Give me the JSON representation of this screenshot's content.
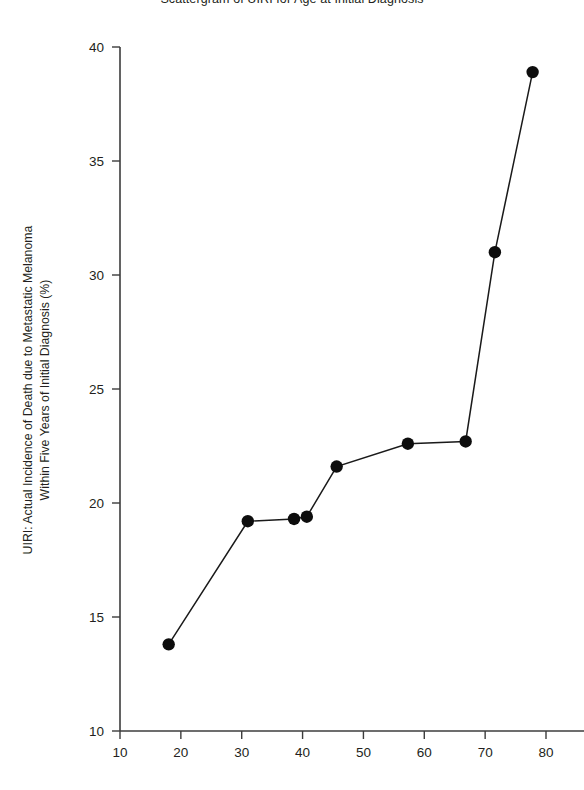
{
  "chart_data": {
    "type": "scatter",
    "title": "Scattergram of UIRI for Age at Initial Diagnosis",
    "xlabel": "",
    "ylabel": "UIRI: Actual Incidence of Death due to Metastatic Melanoma Within Five Years of Initial Diagnosis (%)",
    "ylabel_line1": "UIRI: Actual Incidence of Death due to Metastatic Melanoma",
    "ylabel_line2": "Within Five Years of Initial Diagnosis (%)",
    "xlim": [
      10,
      84
    ],
    "ylim": [
      10,
      40
    ],
    "xticks": [
      10,
      20,
      30,
      40,
      50,
      60,
      70,
      80
    ],
    "yticks": [
      10,
      15,
      20,
      25,
      30,
      35,
      40
    ],
    "grid": false,
    "legend": null,
    "connected": true,
    "marker": "filled-circle",
    "marker_color": "#0d0d0d",
    "line_color": "#1a1a1a",
    "x": [
      18,
      31,
      38.6,
      40.7,
      45.6,
      57.3,
      66.8,
      71.6,
      77.8
    ],
    "y": [
      13.8,
      19.2,
      19.3,
      19.4,
      21.6,
      22.6,
      22.7,
      31.0,
      38.9
    ],
    "points": [
      {
        "x": 18,
        "y": 13.8
      },
      {
        "x": 31,
        "y": 19.2
      },
      {
        "x": 38.6,
        "y": 19.3
      },
      {
        "x": 40.7,
        "y": 19.4
      },
      {
        "x": 45.6,
        "y": 21.6
      },
      {
        "x": 57.3,
        "y": 22.6
      },
      {
        "x": 66.8,
        "y": 22.7
      },
      {
        "x": 71.6,
        "y": 31.0
      },
      {
        "x": 77.8,
        "y": 38.9
      }
    ]
  }
}
